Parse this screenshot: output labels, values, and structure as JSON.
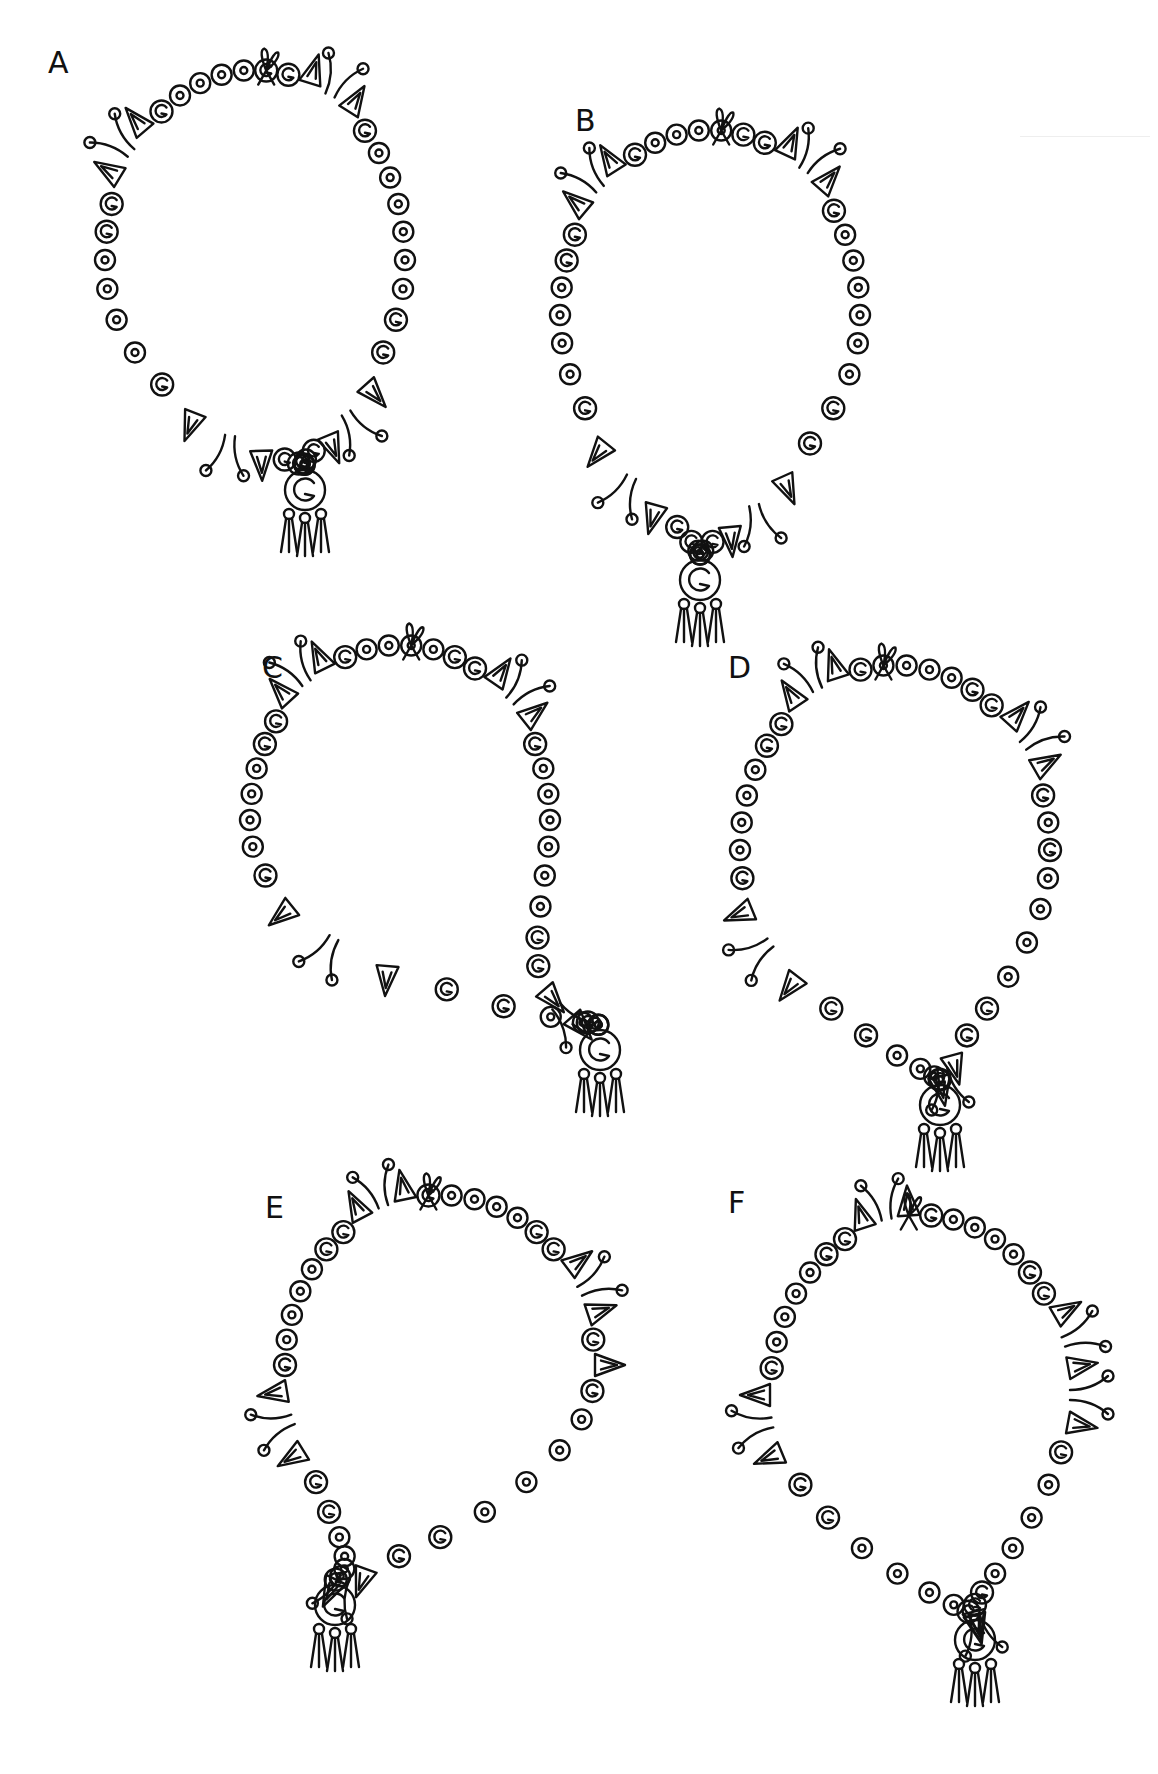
{
  "page": {
    "background": "#ffffff",
    "ink_color": "#111111"
  },
  "necklaces": [
    {
      "id": "A",
      "label": "A",
      "label_pos": [
        48,
        60
      ],
      "cx": 255,
      "cy": 260,
      "rx": 150,
      "ry": 190,
      "pendant": [
        305,
        490
      ],
      "tilt": 0
    },
    {
      "id": "B",
      "label": "B",
      "label_pos": [
        575,
        118
      ],
      "cx": 710,
      "cy": 315,
      "rx": 150,
      "ry": 185,
      "pendant": [
        700,
        580
      ],
      "tilt": 0
    },
    {
      "id": "C",
      "label": "C",
      "label_pos": [
        262,
        665
      ],
      "cx": 400,
      "cy": 820,
      "rx": 150,
      "ry": 175,
      "pendant": [
        600,
        1050
      ],
      "tilt": 0
    },
    {
      "id": "D",
      "label": "D",
      "label_pos": [
        728,
        665
      ],
      "cx": 895,
      "cy": 850,
      "rx": 155,
      "ry": 185,
      "pendant": [
        940,
        1105
      ],
      "tilt": 0
    },
    {
      "id": "E",
      "label": "E",
      "label_pos": [
        265,
        1205
      ],
      "cx": 440,
      "cy": 1365,
      "rx": 155,
      "ry": 170,
      "pendant": [
        335,
        1605
      ],
      "tilt": 0
    },
    {
      "id": "F",
      "label": "F",
      "label_pos": [
        728,
        1200
      ],
      "cx": 920,
      "cy": 1395,
      "rx": 150,
      "ry": 180,
      "pendant": [
        975,
        1640
      ],
      "tilt": 0
    }
  ]
}
